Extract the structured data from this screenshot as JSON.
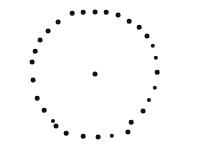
{
  "figure": {
    "width": 208,
    "height": 161,
    "background_color": "#ffffff",
    "title": "",
    "xlabel": "",
    "ylabel": "",
    "point_color": "#111111",
    "point_marker": "filled-circle"
  },
  "chart_data": {
    "type": "scatter",
    "title": "",
    "subtitle": "",
    "xlabel": "",
    "ylabel": "",
    "grid": false,
    "legend": null,
    "axes_visible": false,
    "xlim": [
      0,
      208
    ],
    "ylim": [
      0,
      161
    ],
    "annotations": [],
    "series": [
      {
        "name": "ring",
        "point_count": 28,
        "marker": "filled-circle",
        "color": "#111111",
        "marker_size": 4.6,
        "geometry": {
          "shape": "circle",
          "center_x": 95,
          "center_y": 74,
          "radius": 62
        },
        "points": [
          {
            "x": 95,
            "y": 12,
            "r": 2.4
          },
          {
            "x": 106,
            "y": 12,
            "r": 2.3
          },
          {
            "x": 118,
            "y": 15,
            "r": 2.4
          },
          {
            "x": 129,
            "y": 21,
            "r": 2.3
          },
          {
            "x": 139,
            "y": 27,
            "r": 2.3
          },
          {
            "x": 147,
            "y": 36,
            "r": 2.5
          },
          {
            "x": 153,
            "y": 46,
            "r": 2.2
          },
          {
            "x": 156,
            "y": 58,
            "r": 2.2
          },
          {
            "x": 157,
            "y": 72,
            "r": 2.3
          },
          {
            "x": 155,
            "y": 88,
            "r": 2.2
          },
          {
            "x": 149,
            "y": 100,
            "r": 2.1
          },
          {
            "x": 143,
            "y": 111,
            "r": 2.4
          },
          {
            "x": 131,
            "y": 122,
            "r": 2.3
          },
          {
            "x": 128,
            "y": 132,
            "r": 2.6
          },
          {
            "x": 112,
            "y": 136,
            "r": 2.2
          },
          {
            "x": 98,
            "y": 137,
            "r": 2.4
          },
          {
            "x": 83,
            "y": 136,
            "r": 2.3
          },
          {
            "x": 66,
            "y": 133,
            "r": 2.3
          },
          {
            "x": 56,
            "y": 126,
            "r": 2.5
          },
          {
            "x": 53,
            "y": 121,
            "r": 2.0
          },
          {
            "x": 44,
            "y": 110,
            "r": 2.3
          },
          {
            "x": 37,
            "y": 98,
            "r": 2.3
          },
          {
            "x": 33,
            "y": 80,
            "r": 2.4
          },
          {
            "x": 32,
            "y": 62,
            "r": 2.4
          },
          {
            "x": 35,
            "y": 51,
            "r": 2.3
          },
          {
            "x": 40,
            "y": 40,
            "r": 2.4
          },
          {
            "x": 48,
            "y": 31,
            "r": 2.4
          },
          {
            "x": 58,
            "y": 22,
            "r": 2.4
          },
          {
            "x": 72,
            "y": 13,
            "r": 2.3
          },
          {
            "x": 83,
            "y": 12,
            "r": 2.3
          }
        ]
      },
      {
        "name": "center",
        "point_count": 1,
        "marker": "filled-circle",
        "color": "#111111",
        "marker_size": 4.6,
        "points": [
          {
            "x": 95,
            "y": 74,
            "r": 2.5
          }
        ]
      }
    ]
  }
}
